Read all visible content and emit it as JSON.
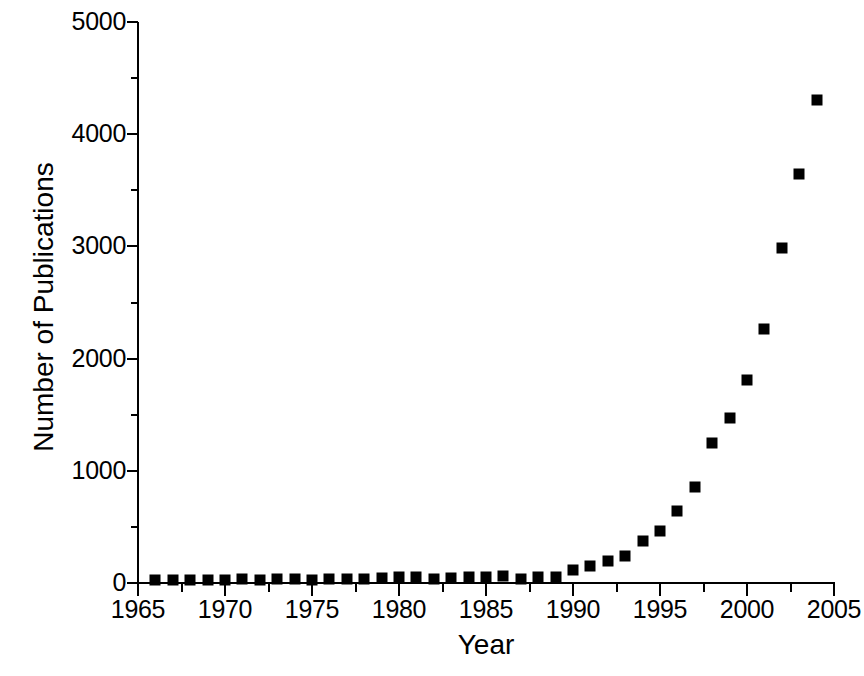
{
  "chart_data": {
    "type": "scatter",
    "title": "",
    "xlabel": "Year",
    "ylabel": "Number of Publications",
    "xlim": [
      1965,
      2005
    ],
    "ylim": [
      0,
      5000
    ],
    "grid": false,
    "legend": "none",
    "marker": "filled-square",
    "marker_color": "#000000",
    "x_major_ticks": [
      1965,
      1970,
      1975,
      1980,
      1985,
      1990,
      1995,
      2000,
      2005
    ],
    "x_minor_ticks": [
      1967.5,
      1972.5,
      1977.5,
      1982.5,
      1987.5,
      1992.5,
      1997.5,
      2002.5
    ],
    "x_tick_labels": [
      "1965",
      "1970",
      "1975",
      "1980",
      "1985",
      "1990",
      "1995",
      "2000",
      "2005"
    ],
    "y_major_ticks": [
      0,
      1000,
      2000,
      3000,
      4000,
      5000
    ],
    "y_minor_ticks": [
      500,
      1500,
      2500,
      3500,
      4500
    ],
    "y_tick_labels": [
      "0",
      "1000",
      "2000",
      "3000",
      "4000",
      "5000"
    ],
    "x": [
      1966,
      1967,
      1968,
      1969,
      1970,
      1971,
      1972,
      1973,
      1974,
      1975,
      1976,
      1977,
      1978,
      1979,
      1980,
      1981,
      1982,
      1983,
      1984,
      1985,
      1986,
      1987,
      1988,
      1989,
      1990,
      1991,
      1992,
      1993,
      1994,
      1995,
      1996,
      1997,
      1998,
      1999,
      2000,
      2001,
      2002,
      2003,
      2004
    ],
    "values": [
      30,
      28,
      26,
      30,
      30,
      32,
      30,
      34,
      32,
      30,
      36,
      38,
      40,
      42,
      55,
      50,
      38,
      46,
      52,
      53,
      62,
      36,
      53,
      53,
      116,
      151,
      196,
      240,
      374,
      463,
      642,
      856,
      1248,
      1470,
      1809,
      2264,
      2986,
      3645,
      4305
    ]
  },
  "axis_titles": {
    "x": "Year",
    "y": "Number of Publications"
  }
}
